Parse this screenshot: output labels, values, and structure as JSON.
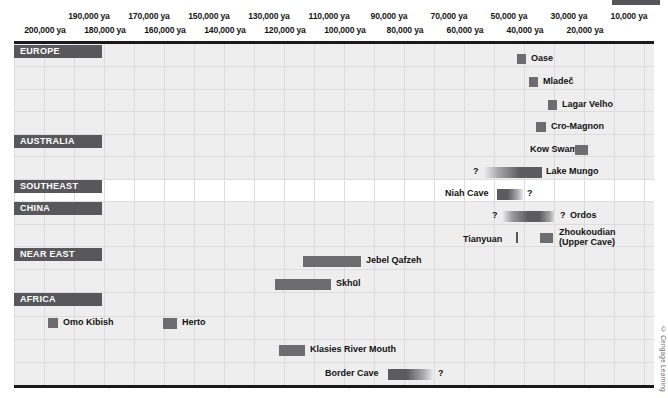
{
  "credit": "© Cengage Learning",
  "axis": {
    "unit": "ya",
    "top_ticks": [
      {
        "label": "190,000 ya",
        "value": 190000
      },
      {
        "label": "170,000 ya",
        "value": 170000
      },
      {
        "label": "150,000 ya",
        "value": 150000
      },
      {
        "label": "130,000 ya",
        "value": 130000
      },
      {
        "label": "110,000 ya",
        "value": 110000
      },
      {
        "label": "90,000 ya",
        "value": 90000
      },
      {
        "label": "70,000 ya",
        "value": 70000
      },
      {
        "label": "50,000 ya",
        "value": 50000
      },
      {
        "label": "30,000 ya",
        "value": 30000
      },
      {
        "label": "10,000 ya",
        "value": 10000
      }
    ],
    "bottom_ticks": [
      {
        "label": "200,000 ya",
        "value": 200000
      },
      {
        "label": "180,000 ya",
        "value": 180000
      },
      {
        "label": "160,000 ya",
        "value": 160000
      },
      {
        "label": "140,000 ya",
        "value": 140000
      },
      {
        "label": "120,000 ya",
        "value": 120000
      },
      {
        "label": "100,000 ya",
        "value": 100000
      },
      {
        "label": "80,000 ya",
        "value": 80000
      },
      {
        "label": "60,000 ya",
        "value": 60000
      },
      {
        "label": "40,000 ya",
        "value": 40000
      },
      {
        "label": "20,000 ya",
        "value": 20000
      }
    ]
  },
  "regions": [
    {
      "name": "EUROPE",
      "tag_width": 88
    },
    {
      "name": "AUSTRALIA",
      "tag_width": 88
    },
    {
      "name": "SOUTHEAST ASIA",
      "tag_width": 88
    },
    {
      "name": "CHINA",
      "tag_width": 88
    },
    {
      "name": "NEAR EAST",
      "tag_width": 88
    },
    {
      "name": "AFRICA",
      "tag_width": 88
    }
  ],
  "chart_data": {
    "type": "bar",
    "orientation": "horizontal-timeline",
    "title": "",
    "xlabel": "years ago (ya)",
    "ylabel": "",
    "xlim": [
      205000,
      5000
    ],
    "x_direction": "oldest-left-to-youngest-right",
    "grid": "vertical, every 10,000 years",
    "legend": "none",
    "annotation_symbol": "?",
    "annotation_meaning": "uncertain date range",
    "groups": [
      {
        "region": "EUROPE",
        "entries": [
          {
            "label": "Oase",
            "start": 37000,
            "end": 34500,
            "uncertain_start": false,
            "uncertain_end": false,
            "label_side": "right"
          },
          {
            "label": "Mladeč",
            "start": 33000,
            "end": 30500,
            "uncertain_start": false,
            "uncertain_end": false,
            "label_side": "right"
          },
          {
            "label": "Lagar Velho",
            "start": 26500,
            "end": 24500,
            "uncertain_start": false,
            "uncertain_end": false,
            "label_side": "right"
          },
          {
            "label": "Cro-Magnon",
            "start": 31000,
            "end": 28000,
            "uncertain_start": false,
            "uncertain_end": false,
            "label_side": "right"
          }
        ]
      },
      {
        "region": "AUSTRALIA",
        "entries": [
          {
            "label": "Kow Swamp",
            "start": 18000,
            "end": 14000,
            "uncertain_start": false,
            "uncertain_end": false,
            "label_side": "left"
          },
          {
            "label": "Lake Mungo",
            "start": 50000,
            "end": 31000,
            "uncertain_start": true,
            "uncertain_end": false,
            "label_side": "right"
          }
        ]
      },
      {
        "region": "SOUTHEAST ASIA",
        "entries": [
          {
            "label": "Niah Cave",
            "start": 46000,
            "end": 38000,
            "uncertain_start": false,
            "uncertain_end": true,
            "label_side": "left"
          }
        ]
      },
      {
        "region": "CHINA",
        "entries": [
          {
            "label": "Ordos",
            "start": 44000,
            "end": 27000,
            "uncertain_start": true,
            "uncertain_end": true,
            "label_side": "right"
          },
          {
            "label": "Tianyuan",
            "start": 40000,
            "end": 40000,
            "uncertain_start": false,
            "uncertain_end": false,
            "label_side": "left",
            "marker": "tick"
          },
          {
            "label": "Zhoukoudian (Upper Cave)",
            "start": 32000,
            "end": 28000,
            "uncertain_start": false,
            "uncertain_end": false,
            "label_side": "right"
          }
        ]
      },
      {
        "region": "NEAR EAST",
        "entries": [
          {
            "label": "Jebel Qafzeh",
            "start": 110000,
            "end": 90000,
            "uncertain_start": false,
            "uncertain_end": false,
            "label_side": "right"
          },
          {
            "label": "Skhūl",
            "start": 119000,
            "end": 100000,
            "uncertain_start": false,
            "uncertain_end": false,
            "label_side": "right"
          }
        ]
      },
      {
        "region": "AFRICA",
        "entries": [
          {
            "label": "Omo Kibish",
            "start": 196000,
            "end": 192000,
            "uncertain_start": false,
            "uncertain_end": false,
            "label_side": "right"
          },
          {
            "label": "Herto",
            "start": 160000,
            "end": 154000,
            "uncertain_start": false,
            "uncertain_end": false,
            "label_side": "right"
          },
          {
            "label": "Klasies River Mouth",
            "start": 122000,
            "end": 113000,
            "uncertain_start": false,
            "uncertain_end": false,
            "label_side": "right"
          },
          {
            "label": "Border Cave",
            "start": 85000,
            "end": 70000,
            "uncertain_start": false,
            "uncertain_end": true,
            "label_side": "left"
          }
        ]
      }
    ]
  }
}
